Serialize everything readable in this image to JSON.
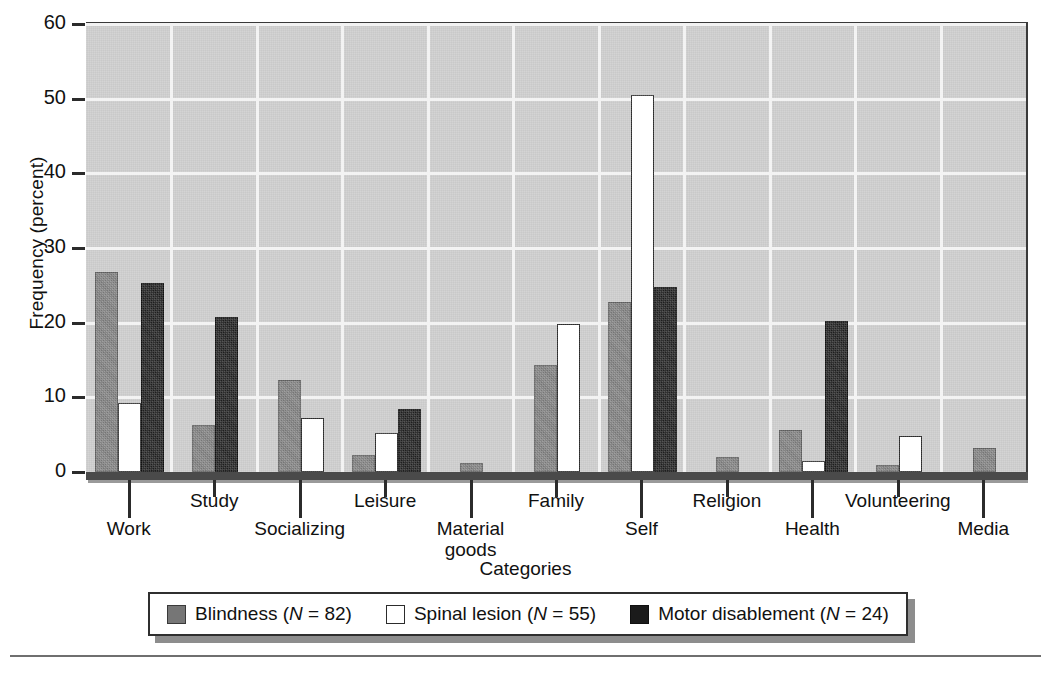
{
  "chart_data": {
    "type": "bar",
    "title": "",
    "xlabel": "Categories",
    "ylabel": "Frequency (percent)",
    "ylim": [
      0,
      60
    ],
    "yticks": [
      0,
      10,
      20,
      30,
      40,
      50,
      60
    ],
    "grid": true,
    "legend_position": "bottom",
    "categories": [
      "Work",
      "Study",
      "Socializing",
      "Leisure",
      "Material goods",
      "Family",
      "Self",
      "Religion",
      "Health",
      "Volunteering",
      "Media"
    ],
    "category_lines": [
      [
        "Work"
      ],
      [
        "Study"
      ],
      [
        "Socializing"
      ],
      [
        "Leisure"
      ],
      [
        "Material",
        "goods"
      ],
      [
        "Family"
      ],
      [
        "Self"
      ],
      [
        "Religion"
      ],
      [
        "Health"
      ],
      [
        "Volunteering"
      ],
      [
        "Media"
      ]
    ],
    "series": [
      {
        "name": "Blindness (N = 82)",
        "swatch": "gray",
        "color": "#767676",
        "values": [
          26.5,
          6.0,
          12.0,
          2.0,
          1.0,
          14.0,
          22.5,
          1.8,
          5.4,
          0.7,
          3.0
        ]
      },
      {
        "name": "Spinal lesion (N = 55)",
        "swatch": "white",
        "color": "#ffffff",
        "values": [
          9.0,
          0,
          7.0,
          5.0,
          0,
          19.5,
          50.2,
          0,
          1.2,
          4.5,
          0
        ]
      },
      {
        "name": "Motor disablement (N = 24)",
        "swatch": "black",
        "color": "#1e1e1e",
        "values": [
          25.0,
          20.5,
          0,
          8.2,
          0,
          0,
          24.5,
          0,
          20.0,
          0,
          0
        ]
      }
    ]
  },
  "legend": {
    "items": [
      {
        "label_text": "Blindness (",
        "n_symbol": "N",
        "n_value": " = 82)",
        "swatch": "gray"
      },
      {
        "label_text": "Spinal lesion (",
        "n_symbol": "N",
        "n_value": " = 55)",
        "swatch": "white"
      },
      {
        "label_text": "Motor disablement (",
        "n_symbol": "N",
        "n_value": " = 24)",
        "swatch": "black"
      }
    ]
  }
}
